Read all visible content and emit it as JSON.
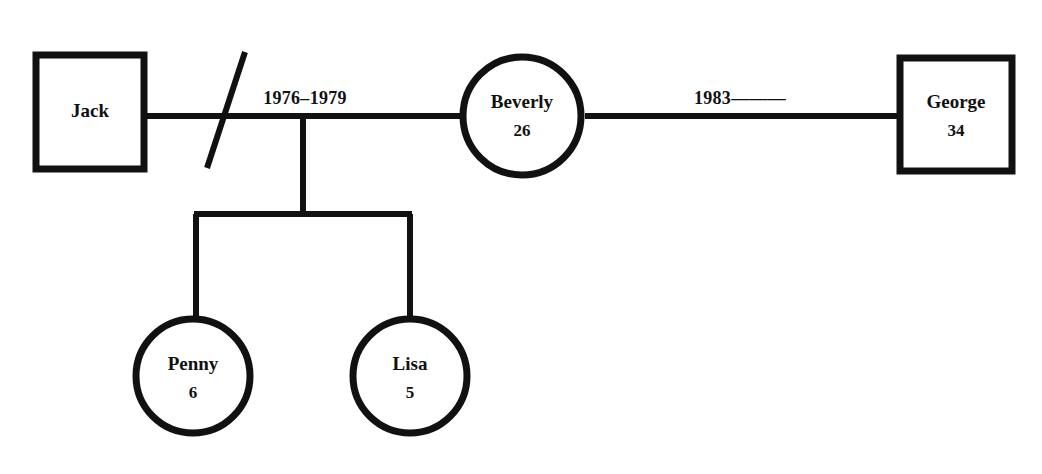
{
  "diagram": {
    "type": "genogram",
    "background_color": "#ffffff",
    "line_color": "#111111",
    "width": 1042,
    "height": 474
  },
  "people": [
    {
      "id": "jack",
      "name": "Jack",
      "age": "",
      "gender": "male",
      "shape": "square",
      "x": 33,
      "y": 52,
      "size": 114
    },
    {
      "id": "beverly",
      "name": "Beverly",
      "age": "26",
      "gender": "female",
      "shape": "circle",
      "cx": 522,
      "cy": 116,
      "r": 62
    },
    {
      "id": "george",
      "name": "George",
      "age": "34",
      "gender": "male",
      "shape": "square",
      "x": 896,
      "y": 55,
      "size": 119
    },
    {
      "id": "penny",
      "name": "Penny",
      "age": "6",
      "gender": "female",
      "shape": "circle",
      "cx": 193,
      "cy": 376,
      "r": 60
    },
    {
      "id": "lisa",
      "name": "Lisa",
      "age": "5",
      "gender": "female",
      "shape": "circle",
      "cx": 410,
      "cy": 376,
      "r": 60
    }
  ],
  "relationships": [
    {
      "id": "jack-beverly",
      "partners": [
        "jack",
        "beverly"
      ],
      "label": "1976–1979",
      "status": "divorced",
      "marker": "single-slash"
    },
    {
      "id": "beverly-george",
      "partners": [
        "beverly",
        "george"
      ],
      "label": "1983———",
      "status": "married-ongoing",
      "marker": "none"
    }
  ],
  "children": [
    {
      "id": "penny",
      "parents": "jack-beverly"
    },
    {
      "id": "lisa",
      "parents": "jack-beverly"
    }
  ],
  "labels": {
    "marriage_1": "1976–1979",
    "marriage_2": "1983———",
    "jack_name": "Jack",
    "beverly_name": "Beverly",
    "beverly_age": "26",
    "george_name": "George",
    "george_age": "34",
    "penny_name": "Penny",
    "penny_age": "6",
    "lisa_name": "Lisa",
    "lisa_age": "5"
  }
}
